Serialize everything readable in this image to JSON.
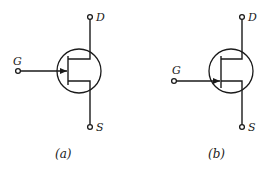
{
  "figure": {
    "panels": [
      {
        "id": "a",
        "caption": "(a)",
        "terminals": {
          "gate": "G",
          "drain": "D",
          "source": "S"
        },
        "arrow_direction": "inward",
        "gate_position": "center"
      },
      {
        "id": "b",
        "caption": "(b)",
        "terminals": {
          "gate": "G",
          "drain": "D",
          "source": "S"
        },
        "arrow_direction": "inward",
        "gate_position": "source-side"
      }
    ],
    "colors": {
      "ink": "#1a1a1a",
      "background": "#ffffff"
    }
  }
}
